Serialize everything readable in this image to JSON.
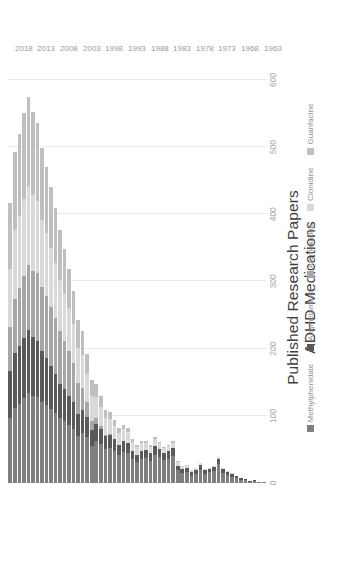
{
  "title": {
    "line1": "Published Research Papers",
    "line2": "ADHD Medications"
  },
  "legend": {
    "items": [
      {
        "label": "Methylphenidate",
        "color": "#7f7f7f"
      },
      {
        "label": "Amphetamine",
        "color": "#595959"
      },
      {
        "label": "Atomoxetine",
        "color": "#a6a6a6"
      },
      {
        "label": "Clonidine",
        "color": "#d9d9d9"
      },
      {
        "label": "Guanfacine",
        "color": "#bfbfbf"
      }
    ]
  },
  "axes": {
    "value_ticks": [
      "0",
      "100",
      "200",
      "300",
      "400",
      "500",
      "600"
    ],
    "value_tick_values": [
      0,
      100,
      200,
      300,
      400,
      500,
      600
    ],
    "value_max": 640,
    "category_ticks": [
      "1963",
      "1968",
      "1973",
      "1978",
      "1983",
      "1988",
      "1993",
      "1998",
      "2003",
      "2008",
      "2013",
      "2018"
    ]
  },
  "chart_data": {
    "type": "bar",
    "orientation": "horizontal-stacked",
    "title": "Published Research Papers ADHD Medications",
    "xlabel": "",
    "ylabel": "",
    "xlim": [
      0,
      640
    ],
    "grid": true,
    "legend_position": "bottom",
    "categories": [
      "1963",
      "1964",
      "1965",
      "1966",
      "1967",
      "1968",
      "1969",
      "1970",
      "1971",
      "1972",
      "1973",
      "1974",
      "1975",
      "1976",
      "1977",
      "1978",
      "1979",
      "1980",
      "1981",
      "1982",
      "1983",
      "1984",
      "1985",
      "1986",
      "1987",
      "1988",
      "1989",
      "1990",
      "1991",
      "1992",
      "1993",
      "1994",
      "1995",
      "1996",
      "1997",
      "1998",
      "1999",
      "2000",
      "2001",
      "2002",
      "2003",
      "2004",
      "2005",
      "2006",
      "2007",
      "2008",
      "2009",
      "2010",
      "2011",
      "2012",
      "2013",
      "2014",
      "2015",
      "2016",
      "2017",
      "2018",
      "2019"
    ],
    "series": [
      {
        "name": "Methylphenidate",
        "color": "#7f7f7f",
        "values": [
          1,
          2,
          3,
          2,
          4,
          5,
          7,
          9,
          12,
          15,
          28,
          18,
          16,
          14,
          20,
          13,
          11,
          17,
          15,
          19,
          40,
          36,
          34,
          38,
          42,
          33,
          37,
          35,
          31,
          36,
          44,
          46,
          41,
          47,
          52,
          50,
          58,
          62,
          55,
          68,
          74,
          70,
          80,
          86,
          92,
          96,
          104,
          110,
          116,
          120,
          128,
          130,
          134,
          126,
          118,
          112,
          96
        ]
      },
      {
        "name": "Amphetamine",
        "color": "#595959",
        "values": [
          0,
          0,
          1,
          1,
          2,
          2,
          3,
          4,
          5,
          6,
          8,
          6,
          5,
          5,
          7,
          6,
          5,
          6,
          6,
          7,
          12,
          11,
          10,
          12,
          13,
          11,
          12,
          12,
          10,
          12,
          16,
          17,
          15,
          18,
          20,
          20,
          23,
          26,
          24,
          30,
          34,
          33,
          40,
          44,
          48,
          52,
          58,
          64,
          70,
          76,
          84,
          88,
          94,
          90,
          86,
          82,
          70
        ]
      },
      {
        "name": "Atomoxetine",
        "color": "#a6a6a6",
        "values": [
          0,
          0,
          0,
          0,
          0,
          0,
          0,
          0,
          0,
          0,
          0,
          0,
          0,
          0,
          0,
          0,
          0,
          0,
          0,
          0,
          0,
          0,
          0,
          0,
          0,
          0,
          0,
          0,
          0,
          0,
          0,
          0,
          0,
          0,
          1,
          2,
          4,
          8,
          14,
          22,
          34,
          46,
          58,
          66,
          72,
          78,
          84,
          88,
          92,
          96,
          100,
          98,
          96,
          92,
          86,
          80,
          66
        ]
      },
      {
        "name": "Clonidine",
        "color": "#d9d9d9",
        "values": [
          0,
          0,
          0,
          0,
          0,
          0,
          0,
          1,
          1,
          1,
          2,
          2,
          2,
          2,
          3,
          3,
          3,
          4,
          4,
          5,
          8,
          8,
          8,
          9,
          10,
          10,
          11,
          12,
          12,
          13,
          16,
          17,
          18,
          20,
          22,
          24,
          28,
          32,
          36,
          42,
          48,
          52,
          58,
          64,
          70,
          76,
          82,
          88,
          94,
          100,
          108,
          112,
          118,
          114,
          108,
          102,
          86
        ]
      },
      {
        "name": "Guanfacine",
        "color": "#bfbfbf",
        "values": [
          0,
          0,
          0,
          0,
          0,
          0,
          0,
          0,
          0,
          0,
          0,
          0,
          0,
          0,
          0,
          0,
          0,
          0,
          0,
          1,
          2,
          2,
          2,
          2,
          3,
          3,
          3,
          4,
          4,
          5,
          6,
          7,
          8,
          9,
          11,
          13,
          16,
          20,
          24,
          30,
          36,
          42,
          50,
          58,
          66,
          74,
          82,
          90,
          98,
          106,
          116,
          124,
          132,
          128,
          122,
          116,
          98
        ]
      }
    ]
  }
}
